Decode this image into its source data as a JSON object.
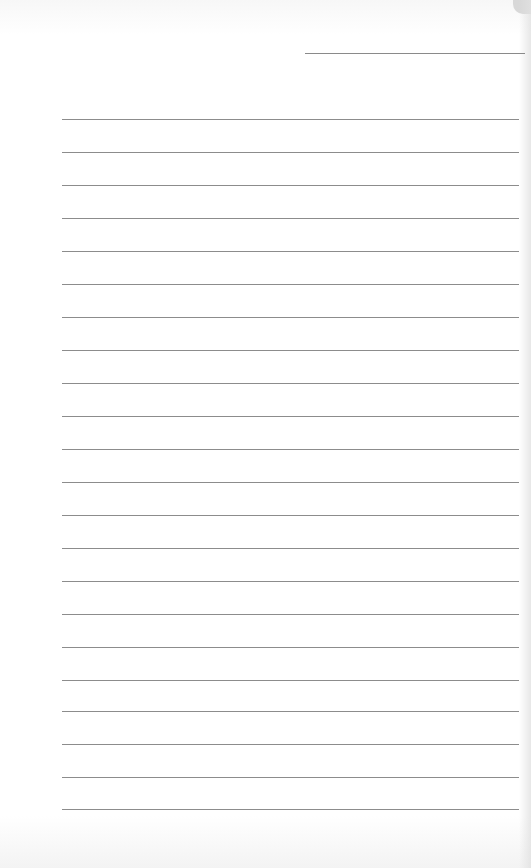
{
  "page": {
    "type": "lined-paper",
    "background_color": "#ffffff",
    "line_color": "#8c8c8c",
    "date_line": {
      "top": 53,
      "left": 305,
      "width": 220
    },
    "rules": {
      "left": 62,
      "width": 457,
      "positions": [
        119,
        152,
        185,
        218,
        251,
        284,
        317,
        350,
        383,
        416,
        449,
        482,
        515,
        548,
        581,
        614,
        647,
        680,
        711,
        744,
        777,
        809
      ]
    },
    "text_content": []
  }
}
